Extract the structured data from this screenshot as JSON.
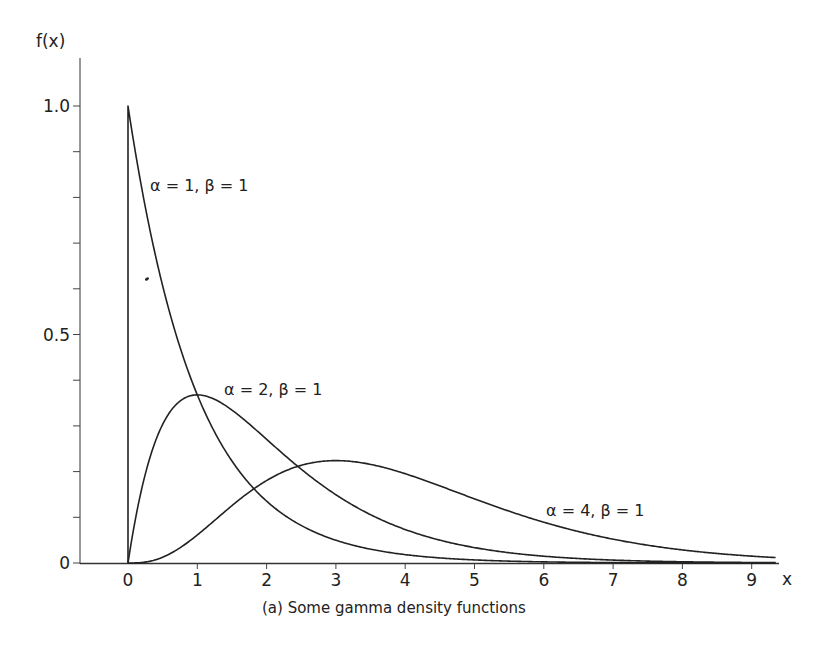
{
  "chart_data": {
    "type": "line",
    "title": "",
    "caption": "(a) Some gamma density functions",
    "xlabel": "x",
    "ylabel": "f(x)",
    "xlim": [
      0,
      9.4
    ],
    "ylim": [
      0,
      1.0
    ],
    "x_ticks": [
      0,
      1,
      2,
      3,
      4,
      5,
      6,
      7,
      8,
      9
    ],
    "x_tick_labels": [
      "0",
      "1",
      "2",
      "3",
      "4",
      "5",
      "6",
      "7",
      "8",
      "9"
    ],
    "y_ticks_major": [
      0,
      0.5,
      1.0
    ],
    "y_tick_labels": [
      "0",
      "0.5",
      "1.0"
    ],
    "y_ticks_minor": [
      0.1,
      0.2,
      0.3,
      0.4,
      0.6,
      0.7,
      0.8,
      0.9
    ],
    "grid": false,
    "legend": "inline labels",
    "series": [
      {
        "name": "α = 1, β = 1",
        "alpha": 1,
        "beta": 1,
        "x": [
          0,
          0.5,
          1,
          1.5,
          2,
          2.5,
          3,
          3.5,
          4,
          4.5,
          5,
          6,
          7,
          8,
          9,
          9.35
        ],
        "values": [
          1.0,
          0.607,
          0.368,
          0.223,
          0.135,
          0.082,
          0.05,
          0.03,
          0.018,
          0.011,
          0.0067,
          0.0025,
          0.0009,
          0.0003,
          0.0001,
          0.0001
        ]
      },
      {
        "name": "α = 2, β = 1",
        "alpha": 2,
        "beta": 1,
        "x": [
          0,
          0.5,
          1,
          1.5,
          2,
          2.5,
          3,
          3.5,
          4,
          4.5,
          5,
          5.5,
          6,
          6.5,
          7,
          8,
          9,
          9.35
        ],
        "values": [
          0,
          0.303,
          0.368,
          0.335,
          0.271,
          0.205,
          0.149,
          0.106,
          0.073,
          0.05,
          0.034,
          0.022,
          0.015,
          0.01,
          0.0064,
          0.0027,
          0.0011,
          0.0008
        ]
      },
      {
        "name": "α = 4, β = 1",
        "alpha": 4,
        "beta": 1,
        "x": [
          0,
          0.5,
          1,
          1.5,
          2,
          2.5,
          3,
          3.5,
          4,
          4.5,
          5,
          5.5,
          6,
          6.5,
          7,
          7.5,
          8,
          8.5,
          9,
          9.35
        ],
        "values": [
          0,
          0.0126,
          0.0613,
          0.126,
          0.18,
          0.214,
          0.224,
          0.216,
          0.195,
          0.169,
          0.14,
          0.113,
          0.089,
          0.069,
          0.052,
          0.039,
          0.029,
          0.021,
          0.015,
          0.012
        ]
      }
    ],
    "annotations": [
      {
        "text": "α = 1, β = 1",
        "x": 0.5,
        "y": 0.82
      },
      {
        "text": "α = 2, β = 1",
        "x": 1.4,
        "y": 0.38
      },
      {
        "text": "α = 4, β = 1",
        "x": 6.0,
        "y": 0.11
      }
    ]
  },
  "labels": {
    "y_axis": "f(x)",
    "x_axis": "x",
    "caption": "(a) Some gamma density functions",
    "curve1": "α = 1, β = 1",
    "curve2": "α = 2, β = 1",
    "curve3": "α = 4, β = 1"
  },
  "colors": {
    "ink": "#222222",
    "background": "#ffffff"
  }
}
